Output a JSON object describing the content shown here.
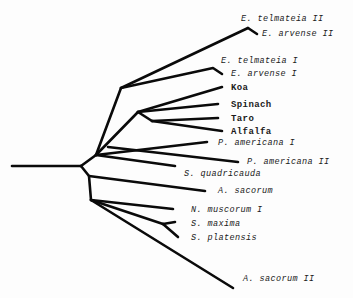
{
  "diagram": {
    "type": "phylogenetic-tree",
    "line_color": "#0a0a0a",
    "taxa": [
      {
        "id": "e_telmateia_2",
        "label": "E. telmateia II",
        "italic": true,
        "x": 241,
        "y": 14
      },
      {
        "id": "e_arvense_2",
        "label": "E. arvense II",
        "italic": true,
        "x": 262,
        "y": 29
      },
      {
        "id": "e_telmateia_1",
        "label": "E. telmateia I",
        "italic": true,
        "x": 221,
        "y": 56
      },
      {
        "id": "e_arvense_1",
        "label": "E. arvense I",
        "italic": true,
        "x": 231,
        "y": 69
      },
      {
        "id": "koa",
        "label": "Koa",
        "italic": false,
        "x": 231,
        "y": 83
      },
      {
        "id": "spinach",
        "label": "Spinach",
        "italic": false,
        "x": 231,
        "y": 100
      },
      {
        "id": "taro",
        "label": "Taro",
        "italic": false,
        "x": 231,
        "y": 114
      },
      {
        "id": "alfalfa",
        "label": "Alfalfa",
        "italic": false,
        "x": 231,
        "y": 127
      },
      {
        "id": "p_americana_1",
        "label": "P. americana I",
        "italic": true,
        "x": 218,
        "y": 138
      },
      {
        "id": "p_americana_2",
        "label": "P. americana II",
        "italic": true,
        "x": 247,
        "y": 157
      },
      {
        "id": "s_quadricauda",
        "label": "S. quadricauda",
        "italic": true,
        "x": 184,
        "y": 169
      },
      {
        "id": "a_sacorum",
        "label": "A. sacorum",
        "italic": true,
        "x": 218,
        "y": 186
      },
      {
        "id": "n_muscorum_1",
        "label": "N. muscorum I",
        "italic": true,
        "x": 191,
        "y": 205
      },
      {
        "id": "s_maxima",
        "label": "S. maxima",
        "italic": true,
        "x": 191,
        "y": 219
      },
      {
        "id": "s_platensis",
        "label": "S. platensis",
        "italic": true,
        "x": 191,
        "y": 233
      },
      {
        "id": "a_sacorum_2",
        "label": "A. sacorum II",
        "italic": true,
        "x": 243,
        "y": 274
      }
    ],
    "branches": [
      {
        "name": "root-branch",
        "points": "12,166 81,166"
      },
      {
        "name": "upper-clade-stem",
        "points": "81,166 96,155"
      },
      {
        "name": "plant-clade-stem",
        "points": "96,155 121,88"
      },
      {
        "name": "e-ii-branch",
        "points": "121,88 248,28 257,34"
      },
      {
        "name": "e-ii-telmateia-branch",
        "points": "248,28 248,28"
      },
      {
        "name": "e-i-branch",
        "points": "121,88 213,68 222,74"
      },
      {
        "name": "koa-stem",
        "points": "96,155 138,112"
      },
      {
        "name": "koa-branch",
        "points": "138,112 222,87"
      },
      {
        "name": "spinach-branch",
        "points": "138,112 218,104"
      },
      {
        "name": "taro-alfalfa-stem",
        "points": "138,112 152,121"
      },
      {
        "name": "taro-branch",
        "points": "152,121 218,118"
      },
      {
        "name": "alfalfa-branch",
        "points": "152,121 222,131"
      },
      {
        "name": "p-americana-i-branch",
        "points": "96,155 207,142"
      },
      {
        "name": "p-americana-ii-branch",
        "points": "108,147 238,162"
      },
      {
        "name": "s-quadricauda-branch",
        "points": "96,155 175,166"
      },
      {
        "name": "lower-clade-stem",
        "points": "81,166 89,176 91,200"
      },
      {
        "name": "a-sacorum-branch",
        "points": "89,176 205,191"
      },
      {
        "name": "n-muscorum-branch",
        "points": "91,200 173,209"
      },
      {
        "name": "spirulina-stem",
        "points": "91,200 163,224"
      },
      {
        "name": "s-maxima-branch",
        "points": "163,224 175,222"
      },
      {
        "name": "s-platensis-branch",
        "points": "163,224 178,237"
      },
      {
        "name": "a-sacorum-ii-branch",
        "points": "91,200 233,288"
      }
    ]
  }
}
